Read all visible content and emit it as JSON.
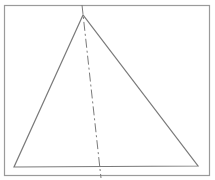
{
  "diagram": {
    "frame": {
      "x": 4.5,
      "y": 5.5,
      "width": 205,
      "height": 170,
      "stroke": "#9a9a9a"
    },
    "triangle": {
      "points": [
        [
          83,
          15
        ],
        [
          14,
          167
        ],
        [
          198,
          166
        ]
      ],
      "stroke": "#7a7a7a"
    },
    "axis_line": {
      "from": [
        82,
        5
      ],
      "to": [
        101,
        178
      ],
      "style": "dash-dot",
      "stroke": "#7a7a7a"
    }
  }
}
